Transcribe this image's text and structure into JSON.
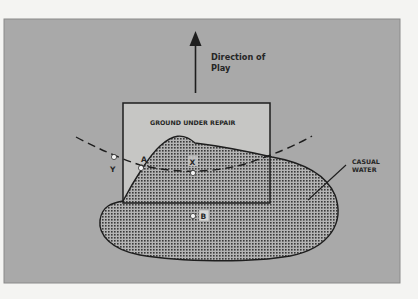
{
  "diagram": {
    "direction_label_line1": "Direction of",
    "direction_label_line2": "Play",
    "gur_label": "GROUND UNDER REPAIR",
    "casual_water_line1": "CASUAL",
    "casual_water_line2": "WATER",
    "points": {
      "A": "A",
      "X": "X",
      "Y": "Y",
      "B": "B"
    }
  },
  "colors": {
    "page_background": "#f4f4f2",
    "panel_background": "#a9a9a9",
    "gur_fill": "#c6c6c4",
    "water_fill": "#8f8f8f",
    "ink": "#262626"
  }
}
